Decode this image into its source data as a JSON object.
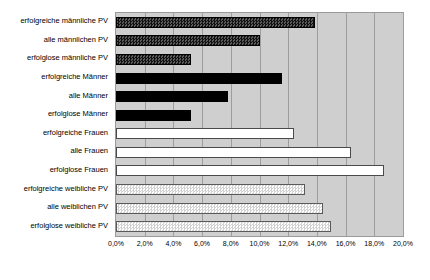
{
  "chart_data": {
    "type": "bar",
    "orientation": "horizontal",
    "title": "",
    "subtitle": "",
    "xlabel": "",
    "ylabel": "",
    "xlim": [
      0,
      20
    ],
    "xunit": "%",
    "grid": true,
    "legend": "none",
    "background": "#cfcfcf",
    "xticks": [
      "0,0%",
      "2,0%",
      "4,0%",
      "6,0%",
      "8,0%",
      "10,0%",
      "12,0%",
      "14,0%",
      "16,0%",
      "18,0%",
      "20,0%"
    ],
    "xtick_values": [
      0,
      2,
      4,
      6,
      8,
      10,
      12,
      14,
      16,
      18,
      20
    ],
    "categories": [
      "erfolgreiche männliche PV",
      "alle männlichen PV",
      "erfolglose männliche PV",
      "erfolgreiche Männer",
      "alle Männer",
      "erfolglose Männer",
      "erfolgreiche Frauen",
      "alle Frauen",
      "erfolglose Frauen",
      "erfolgreiche weibliche PV",
      "alle weiblichen PV",
      "erfolglose weibliche PV"
    ],
    "values": [
      13.9,
      10.0,
      5.2,
      11.6,
      7.8,
      5.2,
      12.4,
      16.4,
      18.7,
      13.2,
      14.4,
      15.0
    ],
    "bar_styles": [
      "s-dark-check",
      "s-dark-check",
      "s-dark-check",
      "s-solid-black",
      "s-solid-black",
      "s-solid-black",
      "s-white",
      "s-white",
      "s-white",
      "s-light-check",
      "s-light-check",
      "s-light-check"
    ],
    "colors": {
      "dark_check": "#121212",
      "solid_black": "#000000",
      "white": "#ffffff",
      "light_check": "#e8e8e8",
      "plot_background": "#cfcfcf",
      "gridline": "#9d9d9d",
      "axis": "#9a9a9a",
      "text": "#000000"
    }
  }
}
